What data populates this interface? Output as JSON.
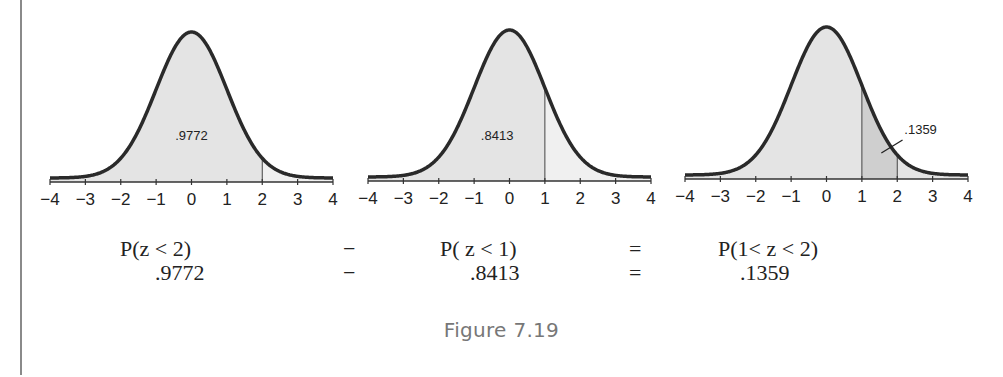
{
  "figure": {
    "caption": "Figure 7.19"
  },
  "colors": {
    "curve": "#2a2a2a",
    "shade_light": "#e4e4e4",
    "shade_dark": "#cfcfcf",
    "unshaded": "#ffffff",
    "axis": "#333333",
    "caption_text": "#777777"
  },
  "chart_data": [
    {
      "type": "area",
      "title": "Standard normal curve: P(z < 2)",
      "x_ticks": [
        -4,
        -3,
        -2,
        -1,
        0,
        1,
        2,
        3,
        4
      ],
      "x_tick_labels": [
        "−4",
        "−3",
        "−2",
        "−1",
        "0",
        "1",
        "2",
        "3",
        "4"
      ],
      "xlim": [
        -4,
        4
      ],
      "shaded_region": {
        "from": -4,
        "to": 2
      },
      "vertical_markers": [
        2
      ],
      "annotation": ".9772",
      "area_value": 0.9772
    },
    {
      "type": "area",
      "title": "Standard normal curve: P(z < 1)",
      "x_ticks": [
        -4,
        -3,
        -2,
        -1,
        0,
        1,
        2,
        3,
        4
      ],
      "x_tick_labels": [
        "−4",
        "−3",
        "−2",
        "−1",
        "0",
        "1",
        "2",
        "3",
        "4"
      ],
      "xlim": [
        -4,
        4
      ],
      "shaded_region": {
        "from": -4,
        "to": 1
      },
      "vertical_markers": [
        1
      ],
      "annotation": ".8413",
      "area_value": 0.8413
    },
    {
      "type": "area",
      "title": "Standard normal curve: P(1 < z < 2)",
      "x_ticks": [
        -4,
        -3,
        -2,
        -1,
        0,
        1,
        2,
        3,
        4
      ],
      "x_tick_labels": [
        "−4",
        "−3",
        "−2",
        "−1",
        "0",
        "1",
        "2",
        "3",
        "4"
      ],
      "xlim": [
        -4,
        4
      ],
      "shaded_region": {
        "from": 1,
        "to": 2
      },
      "vertical_markers": [
        1,
        2
      ],
      "annotation": ".1359",
      "area_value": 0.1359
    }
  ],
  "equation": {
    "row1": {
      "left": "P(z < 2)",
      "op1": "−",
      "middle": "P( z < 1)",
      "op2": "=",
      "right": "P(1< z < 2)"
    },
    "row2": {
      "left": ".9772",
      "op1": "−",
      "middle": ".8413",
      "op2": "=",
      "right": ".1359"
    }
  }
}
